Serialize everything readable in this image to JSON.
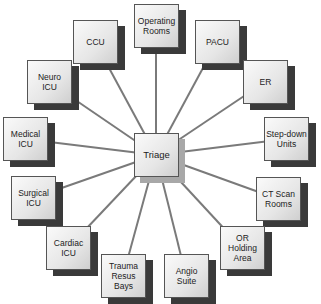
{
  "diagram": {
    "center": {
      "id": "triage",
      "label": "Triage",
      "x": 134,
      "y": 133
    },
    "line_color": "#7a7a7a",
    "nodes": [
      {
        "id": "operating-rooms",
        "label": "Operating\nRooms",
        "x": 134,
        "y": 4
      },
      {
        "id": "pacu",
        "label": "PACU",
        "x": 195,
        "y": 20
      },
      {
        "id": "er",
        "label": "ER",
        "x": 243,
        "y": 60
      },
      {
        "id": "step-down-units",
        "label": "Step-down\nUnits",
        "x": 264,
        "y": 117
      },
      {
        "id": "ct-scan-rooms",
        "label": "CT Scan\nRooms",
        "x": 256,
        "y": 177
      },
      {
        "id": "or-holding-area",
        "label": "OR\nHolding\nArea",
        "x": 220,
        "y": 226
      },
      {
        "id": "angio-suite",
        "label": "Angio\nSuite",
        "x": 164,
        "y": 254
      },
      {
        "id": "trauma-resus-bays",
        "label": "Trauma\nResus\nBays",
        "x": 101,
        "y": 254
      },
      {
        "id": "cardiac-icu",
        "label": "Cardiac\nICU",
        "x": 46,
        "y": 226
      },
      {
        "id": "surgical-icu",
        "label": "Surgical\nICU",
        "x": 11,
        "y": 176
      },
      {
        "id": "medical-icu",
        "label": "Medical\nICU",
        "x": 3,
        "y": 117
      },
      {
        "id": "neuro-icu",
        "label": "Neuro\nICU",
        "x": 27,
        "y": 60
      },
      {
        "id": "ccu",
        "label": "CCU",
        "x": 73,
        "y": 20
      }
    ]
  }
}
